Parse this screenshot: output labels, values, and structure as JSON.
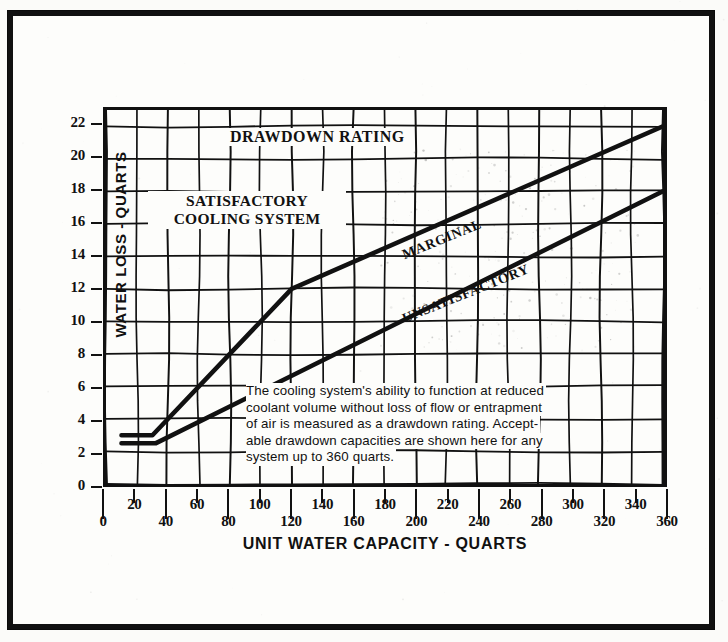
{
  "figure": {
    "in_plot_title": "DRAWDOWN RATING",
    "region_label_satisfactory": "SATISFACTORY\nCOOLING SYSTEM",
    "region_label_satisfactory_line1": "SATISFACTORY",
    "region_label_satisfactory_line2": "COOLING SYSTEM",
    "curve_label_marginal": "MARGINAL",
    "curve_label_unsatisfactory": "UNSATISFACTORY",
    "note_line1": "The cooling system's ability to function at reduced",
    "note_line2": "coolant volume without loss of flow or entrapment",
    "note_line3": "of air is measured as a drawdown rating.  Accept-",
    "note_line4": "able drawdown capacities are shown here for any",
    "note_line5": "system up to 360 quarts.",
    "ink_color": "#111111",
    "paper_color": "#fdfdfb"
  },
  "chart_data": {
    "type": "line",
    "title": "DRAWDOWN RATING",
    "xlabel": "UNIT WATER CAPACITY - QUARTS",
    "ylabel": "WATER LOSS - QUARTS",
    "xlim": [
      0,
      360
    ],
    "ylim": [
      0,
      23
    ],
    "xticks": [
      0,
      20,
      40,
      60,
      80,
      100,
      120,
      140,
      160,
      180,
      200,
      220,
      240,
      260,
      280,
      300,
      320,
      340,
      360
    ],
    "yticks": [
      0,
      2,
      4,
      6,
      8,
      10,
      12,
      14,
      16,
      18,
      20,
      22
    ],
    "grid": true,
    "grid_x_step": 20,
    "grid_y_step": 2,
    "legend": "none",
    "annotations": [
      {
        "text": "DRAWDOWN RATING",
        "x": 175,
        "y": 22
      },
      {
        "text": "SATISFACTORY COOLING SYSTEM",
        "x": 60,
        "y": 16
      },
      {
        "text": "MARGINAL",
        "x": 215,
        "y": 13.5
      },
      {
        "text": "UNSATISFACTORY",
        "x": 225,
        "y": 10.5
      }
    ],
    "series": [
      {
        "name": "MARGINAL",
        "description": "Upper boundary: above this line the cooling system is satisfactory; below it performance is marginal.",
        "x": [
          10,
          30,
          120,
          360
        ],
        "values": [
          3.0,
          3.0,
          12.0,
          22.0
        ]
      },
      {
        "name": "UNSATISFACTORY",
        "description": "Lower boundary: below this line the cooling system is unsatisfactory.",
        "x": [
          10,
          32,
          360
        ],
        "values": [
          2.5,
          2.5,
          18.0
        ]
      }
    ]
  },
  "axes": {
    "y_tick_labels": [
      "22",
      "20",
      "18",
      "16",
      "14",
      "12",
      "10",
      "8",
      "6",
      "4",
      "2",
      "0"
    ],
    "x_tick_labels_upper_row": [
      "20",
      "60",
      "100",
      "140",
      "180",
      "220",
      "260",
      "300",
      "340"
    ],
    "x_tick_labels_lower_row": [
      "0",
      "40",
      "80",
      "120",
      "160",
      "200",
      "240",
      "280",
      "320",
      "360"
    ],
    "y_axis_title": "WATER LOSS - QUARTS",
    "x_axis_title": "UNIT WATER CAPACITY - QUARTS"
  }
}
